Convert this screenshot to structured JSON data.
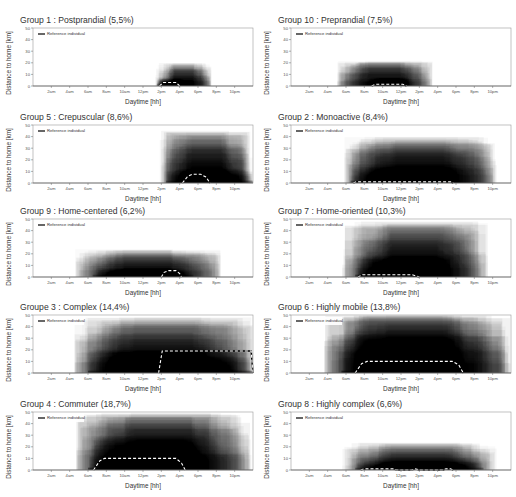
{
  "chart_data": {
    "type": "area",
    "layout": {
      "rows": 5,
      "cols": 2,
      "grid": false,
      "legend_position": "upper-left"
    },
    "shared": {
      "xlabel": "Daytime [hh]",
      "ylabel": "Distance to home [km]",
      "ylim": [
        0,
        50
      ],
      "yticks": [
        0,
        10,
        20,
        30,
        40,
        50
      ],
      "xticks": [
        "2am",
        "4am",
        "6am",
        "8am",
        "10am",
        "12pm",
        "2pm",
        "4pm",
        "6pm",
        "8pm",
        "10pm"
      ],
      "xlim_hours": [
        0,
        24
      ],
      "legend": "Reference individual"
    },
    "panels": [
      {
        "id": "g1",
        "title": "Group 1 : Postprandial (5,5%)",
        "density": {
          "start": 13.3,
          "end": 19.5,
          "peak_height": 20,
          "core_start": 13.5,
          "core_end": 16.5,
          "core_height": 7,
          "intensity": 0.55
        },
        "reference": [
          [
            13.8,
            0
          ],
          [
            14.2,
            3
          ],
          [
            15.6,
            3
          ],
          [
            16,
            0
          ]
        ]
      },
      {
        "id": "g10",
        "title": "Group 10 : Preprandial (7,5%)",
        "density": {
          "start": 5.0,
          "end": 15.5,
          "peak_height": 22,
          "core_start": 8.8,
          "core_end": 13.0,
          "core_height": 8,
          "intensity": 0.55
        },
        "reference": [
          [
            8.8,
            0
          ],
          [
            9.2,
            1.5
          ],
          [
            12.2,
            1.5
          ],
          [
            12.6,
            0
          ]
        ]
      },
      {
        "id": "g5",
        "title": "Group 5 : Crepuscular (8,6%)",
        "density": {
          "start": 13.8,
          "end": 24,
          "peak_height": 45,
          "core_start": 14.5,
          "core_end": 24,
          "core_height": 12,
          "intensity": 0.6
        },
        "reference": [
          [
            16.3,
            0
          ],
          [
            16.9,
            6
          ],
          [
            17.4,
            7.5
          ],
          [
            18.3,
            7.5
          ],
          [
            18.9,
            5
          ],
          [
            19.3,
            0
          ]
        ]
      },
      {
        "id": "g2",
        "title": "Group 2 : Monoactive (8,4%)",
        "density": {
          "start": 5.7,
          "end": 22.5,
          "peak_height": 40,
          "core_start": 6.5,
          "core_end": 18.5,
          "core_height": 15,
          "intensity": 0.7
        },
        "reference": [
          [
            6.8,
            0
          ],
          [
            7.1,
            1
          ],
          [
            17.4,
            1
          ],
          [
            17.7,
            0
          ]
        ]
      },
      {
        "id": "g9",
        "title": "Group 9 : Home-centered (6,2%)",
        "density": {
          "start": 4.5,
          "end": 20.5,
          "peak_height": 24,
          "core_start": 6.5,
          "core_end": 17.5,
          "core_height": 8,
          "intensity": 0.55
        },
        "reference": [
          [
            14,
            0
          ],
          [
            14.3,
            4
          ],
          [
            14.8,
            5.5
          ],
          [
            15.6,
            5.5
          ],
          [
            16,
            3
          ],
          [
            16.2,
            0
          ]
        ]
      },
      {
        "id": "g7",
        "title": "Group 7 : Home-oriented (10,3%)",
        "density": {
          "start": 5.5,
          "end": 21.5,
          "peak_height": 48,
          "core_start": 7.0,
          "core_end": 17.5,
          "core_height": 18,
          "intensity": 0.75
        },
        "reference": [
          [
            7.3,
            0
          ],
          [
            7.8,
            2
          ],
          [
            13.2,
            2
          ],
          [
            14.0,
            0
          ]
        ]
      },
      {
        "id": "g3",
        "title": "Groupe 3 : Complex (14,4%)",
        "density": {
          "start": 4.5,
          "end": 24,
          "peak_height": 48,
          "core_start": 6.0,
          "core_end": 24,
          "core_height": 20,
          "intensity": 0.75
        },
        "reference": [
          [
            13.7,
            0
          ],
          [
            14.1,
            19
          ],
          [
            23.8,
            19
          ],
          [
            24,
            0
          ]
        ]
      },
      {
        "id": "g6",
        "title": "Group 6 : Highly mobile (13,8%)",
        "density": {
          "start": 3.5,
          "end": 24,
          "peak_height": 50,
          "core_start": 5.5,
          "core_end": 19.0,
          "core_height": 50,
          "intensity": 0.9
        },
        "reference": [
          [
            7.0,
            0
          ],
          [
            7.7,
            8
          ],
          [
            8.3,
            10
          ],
          [
            17.6,
            10
          ],
          [
            18.3,
            7
          ],
          [
            18.8,
            0
          ]
        ]
      },
      {
        "id": "g4",
        "title": "Group 4 : Commuter (18,7%)",
        "density": {
          "start": 4.5,
          "end": 24,
          "peak_height": 50,
          "core_start": 6.0,
          "core_end": 18.5,
          "core_height": 30,
          "intensity": 0.85
        },
        "reference": [
          [
            6.6,
            0
          ],
          [
            7.3,
            8
          ],
          [
            7.8,
            10
          ],
          [
            15.6,
            10
          ],
          [
            16.2,
            6
          ],
          [
            16.6,
            0
          ]
        ]
      },
      {
        "id": "g8",
        "title": "Group 8 : Highly complex (6,6%)",
        "density": {
          "start": 5.5,
          "end": 22.5,
          "peak_height": 24,
          "core_start": 7.0,
          "core_end": 21.0,
          "core_height": 9,
          "intensity": 0.6
        },
        "reference": [
          [
            7.6,
            0
          ],
          [
            8.0,
            1
          ],
          [
            11.2,
            1
          ],
          [
            11.5,
            0
          ],
          [
            13.2,
            0
          ],
          [
            13.5,
            1
          ],
          [
            14.0,
            0
          ],
          [
            16.6,
            0
          ],
          [
            16.9,
            1
          ],
          [
            17.4,
            1
          ],
          [
            17.7,
            0
          ]
        ]
      }
    ]
  },
  "panels_view": [
    {
      "title": "Group 1 : Postprandial (5,5%)"
    },
    {
      "title": "Group 10 : Preprandial (7,5%)"
    },
    {
      "title": "Group 5 : Crepuscular (8,6%)"
    },
    {
      "title": "Group 2 : Monoactive (8,4%)"
    },
    {
      "title": "Group 9 : Home-centered (6,2%)"
    },
    {
      "title": "Group 7 : Home-oriented (10,3%)"
    },
    {
      "title": "Groupe 3 : Complex (14,4%)"
    },
    {
      "title": "Group 6 : Highly mobile (13,8%)"
    },
    {
      "title": "Group 4 : Commuter (18,7%)"
    },
    {
      "title": "Group 8 : Highly complex (6,6%)"
    }
  ],
  "labels": {
    "xlabel": "Daytime [hh]",
    "ylabel": "Distance to home [km]",
    "legend": "Reference individual"
  }
}
